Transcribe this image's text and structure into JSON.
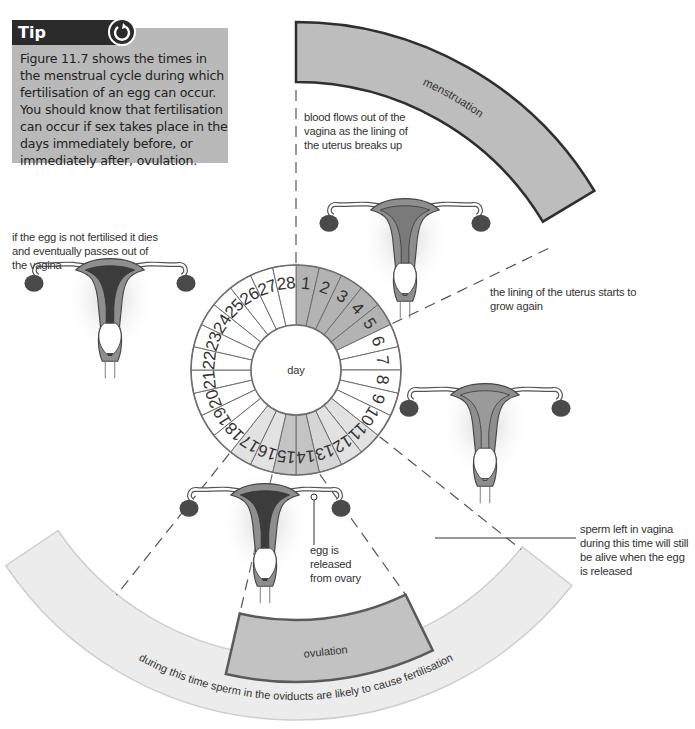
{
  "tip": {
    "heading": "Tip",
    "icon": "refresh-icon",
    "text": "Figure 11.7 shows the times in the menstrual cycle during which fertilisation of an egg can occur. You should know that fertilisation can occur if sex takes place in the days immediately before, or immediately after, ovulation."
  },
  "wheel": {
    "center_label": "day",
    "days": [
      1,
      2,
      3,
      4,
      5,
      6,
      7,
      8,
      9,
      10,
      11,
      12,
      13,
      14,
      15,
      16,
      17,
      18,
      19,
      20,
      21,
      22,
      23,
      24,
      25,
      26,
      27,
      28
    ],
    "menstruation_days": [
      1,
      2,
      3,
      4,
      5
    ],
    "fertile_days": [
      11,
      12,
      13,
      14,
      15,
      16,
      17
    ],
    "ovulation_days": [
      14,
      15
    ],
    "colors": {
      "menstruation": "#b3b3b3",
      "fertile": "#e2e2e2",
      "ovulation": "#c4c4c4",
      "normal": "#ffffff",
      "outline": "#6e6e6e"
    }
  },
  "bands": {
    "menstruation_label": "menstruation",
    "ovulation_label": "ovulation",
    "fertile_caption": "during this time sperm in the oviducts are likely to cause fertilisation"
  },
  "annotations": {
    "menstruation": "blood flows out of the vagina as the lining of the uterus breaks up",
    "lining_grows": "the lining of the uterus starts to grow again",
    "egg_dies": "if the egg is not fertilised it dies and eventually passes out of the vagina",
    "egg_released": "egg is released from ovary",
    "sperm_vagina": "sperm left in vagina during this time will still be alive when the egg is released"
  }
}
